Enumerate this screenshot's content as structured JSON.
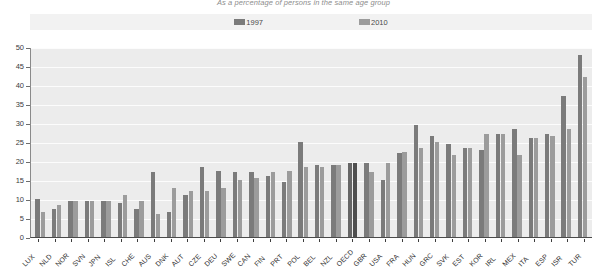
{
  "chart_data": {
    "type": "bar",
    "title": "As a percentage of persons in the same age group",
    "xlabel": "",
    "ylabel": "",
    "ylim": [
      0,
      50
    ],
    "yticks": [
      0,
      5,
      10,
      15,
      20,
      25,
      30,
      35,
      40,
      45,
      50
    ],
    "grid": true,
    "legend_position": "top-center",
    "highlight_category": "OECD",
    "categories": [
      "LUX",
      "NLD",
      "NOR",
      "SVN",
      "JPN",
      "ISL",
      "CHE",
      "AUS",
      "DNK",
      "AUT",
      "CZE",
      "DEU",
      "SWE",
      "CAN",
      "FIN",
      "PRT",
      "POL",
      "BEL",
      "NZL",
      "OECD",
      "GBR",
      "USA",
      "FRA",
      "HUN",
      "GRC",
      "SVK",
      "EST",
      "KOR",
      "IRL",
      "MEX",
      "ITA",
      "ESP",
      "ISR",
      "TUR"
    ],
    "series": [
      {
        "name": "1997",
        "color": "#7b7b7b",
        "values": [
          10.0,
          7.5,
          9.5,
          9.5,
          9.5,
          9.0,
          7.5,
          17.0,
          6.5,
          11.0,
          18.5,
          17.5,
          17.0,
          17.0,
          16.0,
          14.5,
          25.0,
          19.0,
          19.0,
          19.5,
          19.5,
          15.0,
          22.0,
          29.5,
          26.5,
          24.5,
          23.5,
          23.0,
          27.0,
          28.5,
          26.0,
          27.0,
          37.0,
          48.0
        ]
      },
      {
        "name": "2010",
        "color": "#9c9c9c",
        "values": [
          6.5,
          8.5,
          9.5,
          9.5,
          9.5,
          11.0,
          9.5,
          6.0,
          13.0,
          12.0,
          12.0,
          13.0,
          15.0,
          15.5,
          17.0,
          17.5,
          18.5,
          18.5,
          19.0,
          19.5,
          17.0,
          19.5,
          22.5,
          23.5,
          25.0,
          21.5,
          23.5,
          27.0,
          27.0,
          21.5,
          26.0,
          26.5,
          28.5,
          42.0
        ]
      }
    ]
  },
  "legend": {
    "items": [
      {
        "label": "1997",
        "color": "#7b7b7b"
      },
      {
        "label": "2010",
        "color": "#9c9c9c"
      }
    ]
  }
}
